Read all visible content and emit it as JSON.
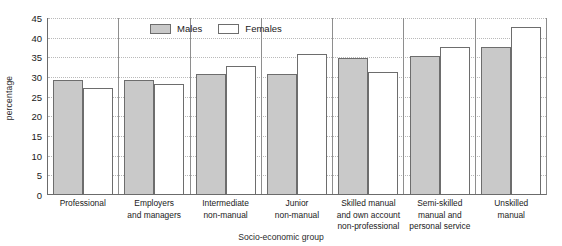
{
  "chart_data": {
    "type": "bar",
    "title": "",
    "xlabel": "Socio-economic group",
    "ylabel": "percentage",
    "ylim": [
      0,
      45
    ],
    "yticks": [
      0,
      5,
      10,
      15,
      20,
      25,
      30,
      35,
      40,
      45
    ],
    "grid": true,
    "legend_position": "top-center",
    "categories": [
      "Professional",
      "Employers and managers",
      "Intermediate non-manual",
      "Junior non-manual",
      "Skilled manual and own account non-professional",
      "Semi-skilled manual and personal service",
      "Unskilled manual"
    ],
    "category_lines": [
      [
        "Professional"
      ],
      [
        "Employers",
        "and managers"
      ],
      [
        "Intermediate",
        "non-manual"
      ],
      [
        "Junior",
        "non-manual"
      ],
      [
        "Skilled manual",
        "and own account",
        "non-professional"
      ],
      [
        "Semi-skilled",
        "manual and",
        "personal service"
      ],
      [
        "Unskilled",
        "manual"
      ]
    ],
    "series": [
      {
        "name": "Males",
        "color": "#c9c9c9",
        "values": [
          29,
          29,
          30.5,
          30.5,
          34.5,
          35,
          37.5
        ]
      },
      {
        "name": "Females",
        "color": "#ffffff",
        "values": [
          27,
          28,
          32.5,
          35.5,
          31,
          37.5,
          42.5
        ]
      }
    ]
  },
  "legend": {
    "males_label": "Males",
    "females_label": "Females"
  }
}
